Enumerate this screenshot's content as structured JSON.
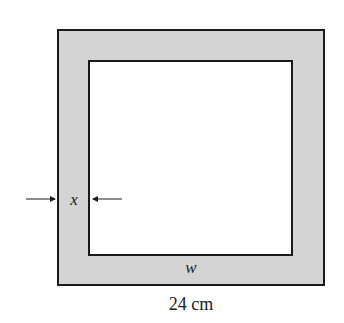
{
  "diagram": {
    "labels": {
      "border_width": "x",
      "inner_width": "w",
      "outer_width": "24 cm"
    },
    "colors": {
      "border_fill": "#d4d4d4",
      "inner_fill": "#ffffff",
      "stroke": "#1a1a1a"
    }
  }
}
